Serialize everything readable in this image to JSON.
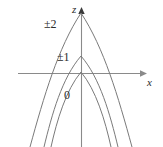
{
  "figure": {
    "background_color": "#ffffff",
    "width": 163,
    "height": 147,
    "axes": {
      "vertical_label": "z",
      "horizontal_label": "x",
      "vertical_axis_x": 81,
      "horizontal_axis_y": 73,
      "axis_color": "#8a8a8a",
      "arrowheads": [
        "up",
        "right"
      ]
    },
    "curve_color": "#7a7a7a"
  },
  "chart_data": {
    "type": "line",
    "title": "",
    "subtitle": "",
    "xlabel": "x",
    "ylabel": "z",
    "xlim": [
      -2.6,
      2.1
    ],
    "ylim": [
      -2.5,
      1.15
    ],
    "grid": false,
    "legend": "inline annotations at each curve",
    "axis_origin": [
      0,
      0
    ],
    "tick_labels": {
      "x": [],
      "y": []
    },
    "annotations": [
      {
        "text": "±2",
        "curve": "outer",
        "x_px": 44,
        "y_px": 18
      },
      {
        "text": "±1",
        "curve": "middle",
        "x_px": 57,
        "y_px": 51
      },
      {
        "text": "0",
        "curve": "inner",
        "x_px": 64,
        "y_px": 89
      },
      {
        "text": "z",
        "role": "axis-label",
        "x_px": 72,
        "y_px": 4
      },
      {
        "text": "x",
        "role": "axis-label",
        "x_px": 147,
        "y_px": 77
      }
    ],
    "series": [
      {
        "name": "±2",
        "label": "±2",
        "description": "outermost, tallest downward parabola; vertex highest above the x-axis",
        "vertex": [
          0,
          1.0
        ],
        "x_intercepts": [
          -1.0,
          1.0
        ],
        "apex_px": [
          81,
          13
        ],
        "path_d": "M 30 147 C 44 96 58 48 81 13 C 104 48 118 96 132 147"
      },
      {
        "name": "±1",
        "label": "±1",
        "description": "middle downward parabola; vertex moderately above the x-axis",
        "vertex": [
          0,
          0.42
        ],
        "x_intercepts": [
          -0.62,
          0.62
        ],
        "apex_px": [
          81,
          56
        ],
        "path_d": "M 44 147 C 52 114 62 78 81 56 C 100 78 110 114 118 147"
      },
      {
        "name": "0",
        "label": "0",
        "description": "innermost downward parabola; vertex sits on the x-axis at the origin",
        "vertex": [
          0,
          0.0
        ],
        "x_intercepts": [
          0.0,
          0.0
        ],
        "apex_px": [
          81,
          72
        ],
        "path_d": "M 51 147 C 57 120 66 90 81 72 C 96 90 105 120 111 147"
      }
    ]
  }
}
